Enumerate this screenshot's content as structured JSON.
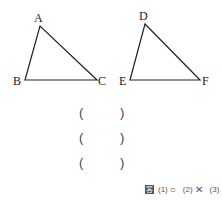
{
  "figures": {
    "triangle_abc": {
      "labels": {
        "a": "A",
        "b": "B",
        "c": "C"
      }
    },
    "triangle_def": {
      "labels": {
        "d": "D",
        "e": "E",
        "f": "F"
      }
    }
  },
  "blanks": [
    {
      "open": "(",
      "close": ")"
    },
    {
      "open": "(",
      "close": ")"
    },
    {
      "open": "(",
      "close": ")"
    }
  ],
  "answer": {
    "icon": "答",
    "items": [
      {
        "num": "(1)",
        "mark": "○"
      },
      {
        "num": "(2)",
        "mark": "✕"
      },
      {
        "num": "(3)",
        "mark": "○"
      }
    ]
  }
}
